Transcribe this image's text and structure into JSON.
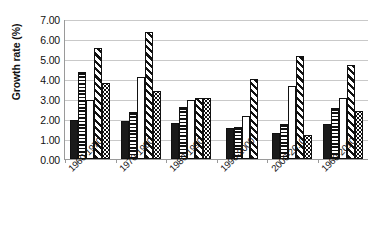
{
  "chart_data": {
    "type": "bar",
    "title": "",
    "xlabel": "",
    "ylabel": "Growth rate (%)",
    "ylim": [
      0,
      7
    ],
    "ytick_labels": [
      "0.00",
      "1.00",
      "2.00",
      "3.00",
      "4.00",
      "5.00",
      "6.00",
      "7.00"
    ],
    "ytick_values": [
      0,
      1,
      2,
      3,
      4,
      5,
      6,
      7
    ],
    "grid": true,
    "legend": "none",
    "categories": [
      "1960-1970",
      "1970-1980",
      "1980-1990",
      "1990-2000",
      "2000-2010",
      "1960-2010"
    ],
    "series": [
      {
        "name": "series-1-solid-black",
        "pattern": "solid",
        "values": [
          1.95,
          1.9,
          1.8,
          1.55,
          1.3,
          1.75
        ]
      },
      {
        "name": "series-2-horizontal-stripe",
        "pattern": "horizontal-stripes",
        "values": [
          4.35,
          2.35,
          2.6,
          1.6,
          1.75,
          2.55
        ]
      },
      {
        "name": "series-3-white",
        "pattern": "plain-white",
        "values": [
          2.95,
          4.1,
          2.95,
          2.15,
          3.65,
          3.05
        ]
      },
      {
        "name": "series-4-diagonal-stripe",
        "pattern": "diagonal-stripes",
        "values": [
          5.55,
          6.35,
          3.05,
          4.0,
          5.15,
          4.7
        ]
      },
      {
        "name": "series-5-dotted",
        "pattern": "dotted",
        "values": [
          3.8,
          3.4,
          3.05,
          0.0,
          1.2,
          2.4
        ]
      }
    ]
  }
}
